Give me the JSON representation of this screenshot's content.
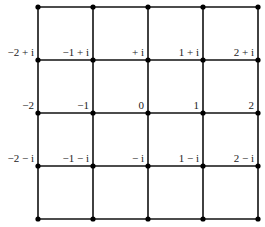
{
  "diagram": {
    "grid": {
      "x_positions": [
        38,
        93,
        148,
        203,
        258
      ],
      "y_positions": [
        7,
        60,
        113,
        166,
        219
      ],
      "line_color": "#111111",
      "node_color": "#000000"
    },
    "labels": [
      {
        "text": "−2 + i",
        "col": 0,
        "row": 1
      },
      {
        "text": "−1 + i",
        "col": 1,
        "row": 1
      },
      {
        "text": "+ i",
        "col": 2,
        "row": 1
      },
      {
        "text": "1 + i",
        "col": 3,
        "row": 1
      },
      {
        "text": "2 + i",
        "col": 4,
        "row": 1
      },
      {
        "text": "−2",
        "col": 0,
        "row": 2
      },
      {
        "text": "−1",
        "col": 1,
        "row": 2
      },
      {
        "text": "0",
        "col": 2,
        "row": 2
      },
      {
        "text": "1",
        "col": 3,
        "row": 2
      },
      {
        "text": "2",
        "col": 4,
        "row": 2
      },
      {
        "text": "−2 − i",
        "col": 0,
        "row": 3
      },
      {
        "text": "−1 − i",
        "col": 1,
        "row": 3
      },
      {
        "text": "− i",
        "col": 2,
        "row": 3
      },
      {
        "text": "1 − i",
        "col": 3,
        "row": 3
      },
      {
        "text": "2 − i",
        "col": 4,
        "row": 3
      }
    ]
  }
}
